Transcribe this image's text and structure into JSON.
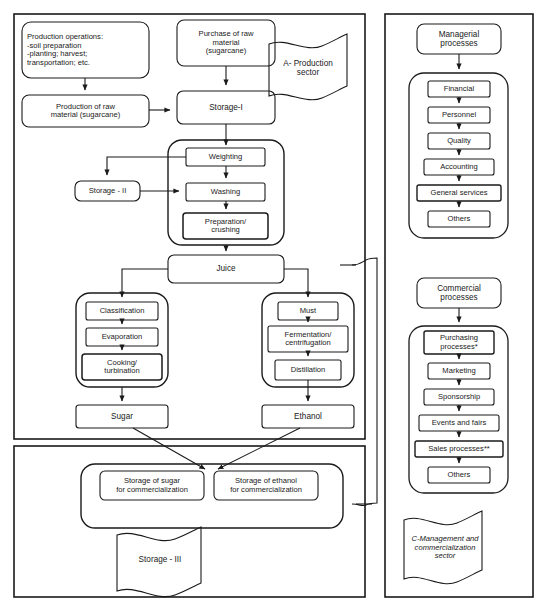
{
  "diagram": {
    "type": "flowchart",
    "background": "#ffffff",
    "line_color": "#1a1a1a"
  },
  "sector_a": {
    "banner_label": "A- Production sector",
    "nodes": {
      "production_operations": "Production operations:\n-soil preparation\n-planting; harvest;\ntransportation; etc.",
      "production_raw_material": "Production of raw\nmaterial (sugarcane)",
      "purchase_raw_material": "Purchase of raw\nmaterial\n(sugarcane)",
      "storage_i": "Storage-I",
      "weighting": "Weighting",
      "storage_ii": "Storage - II",
      "washing": "Washing",
      "preparation_crushing": "Preparation/\ncrushing",
      "juice": "Juice",
      "classification": "Classification",
      "evaporation": "Evaporation",
      "cooking_turbination": "Cooking/\nturbination",
      "sugar": "Sugar",
      "must": "Must",
      "fermentation_centrifugation": "Fermentation/\ncentrifugation",
      "distillation": "Distillation",
      "ethanol": "Ethanol"
    }
  },
  "sector_b": {
    "banner_label": "Storage - III",
    "nodes": {
      "storage_sugar": "Storage of sugar\nfor commercialization",
      "storage_ethanol": "Storage of ethanol\nfor commercialization"
    }
  },
  "sector_c": {
    "banner_label": "C-Management and\ncommercialization\nsector",
    "managerial": {
      "header": "Managerial\nprocesses",
      "items": [
        "Financial",
        "Personnel",
        "Quality",
        "Accounting",
        "General services",
        "Others"
      ]
    },
    "commercial": {
      "header": "Commercial\nprocesses",
      "items": [
        "Purchasing\nprocesses*",
        "Marketing",
        "Sponsorship",
        "Events and fairs",
        "Sales processes**",
        "Others"
      ]
    }
  }
}
